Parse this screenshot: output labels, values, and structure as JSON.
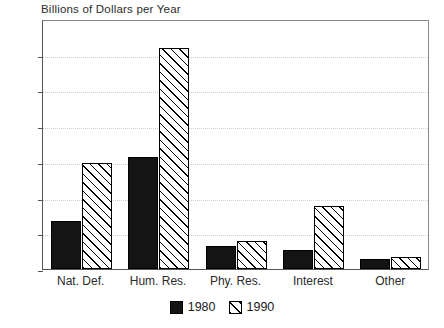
{
  "chart_data": {
    "type": "bar",
    "title": "Billions of Dollars per Year",
    "xlabel": "",
    "ylabel": "",
    "ylim": [
      0,
      700
    ],
    "ytick_step": 100,
    "yticks": [
      0,
      100,
      200,
      300,
      400,
      500,
      600,
      700
    ],
    "ytick_labels": [
      "0",
      "100",
      "200",
      "300",
      "400",
      "500",
      "600",
      "700"
    ],
    "grid": true,
    "grid_style": "dotted",
    "legend_position": "bottom-center",
    "categories": [
      "Nat. Def.",
      "Hum. Res.",
      "Phy. Res.",
      "Interest",
      "Other"
    ],
    "series": [
      {
        "name": "1980",
        "fill": "solid-black",
        "color": "#141414",
        "values": [
          134,
          313,
          65,
          53,
          27
        ]
      },
      {
        "name": "1990",
        "fill": "diagonal-hatch",
        "color": "#ffffff",
        "values": [
          298,
          618,
          78,
          176,
          33
        ]
      }
    ]
  },
  "legend": {
    "entries": [
      {
        "label": "1980",
        "swatch": "solid-black-swatch"
      },
      {
        "label": "1990",
        "swatch": "diagonal-hatch-swatch"
      }
    ]
  }
}
